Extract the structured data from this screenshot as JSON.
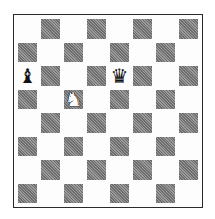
{
  "board": {
    "orientation": "white-bottom",
    "top_left_square": "light",
    "colors": {
      "light": "#fdfdfd",
      "dark": "#7f7f7f",
      "border": "#2a2a2a"
    },
    "pieces": [
      {
        "square": "a6",
        "color": "black",
        "type": "bishop",
        "glyph": "♝"
      },
      {
        "square": "e6",
        "color": "black",
        "type": "queen",
        "glyph": "♛"
      },
      {
        "square": "c5",
        "color": "white",
        "type": "knight",
        "glyph": "♞"
      }
    ]
  }
}
